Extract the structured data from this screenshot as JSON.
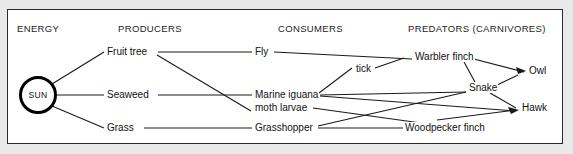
{
  "diagram": {
    "frame_color": "#2b2b2b",
    "background_color": "#e9e9e9",
    "line_color": "#1a1a1a",
    "columns": [
      {
        "label": "ENERGY",
        "x": 17
      },
      {
        "label": "PRODUCERS",
        "x": 118
      },
      {
        "label": "CONSUMERS",
        "x": 278
      },
      {
        "label": "PREDATORS (CARNIVORES)",
        "x": 408
      }
    ],
    "nodes": {
      "sun": {
        "label": "SUN",
        "x": 19,
        "y": 76
      },
      "fruit_tree": {
        "label": "Fruit tree",
        "x": 106,
        "y": 49
      },
      "seaweed": {
        "label": "Seaweed",
        "x": 106,
        "y": 86
      },
      "grass": {
        "label": "Grass",
        "x": 106,
        "y": 122
      },
      "fly": {
        "label": "Fly",
        "x": 254,
        "y": 49
      },
      "marine_iguana": {
        "label": "Marine iguana",
        "x": 254,
        "y": 87
      },
      "moth_larvae": {
        "label": "moth larvae",
        "x": 254,
        "y": 105
      },
      "grasshopper": {
        "label": "Grasshopper",
        "x": 254,
        "y": 124
      },
      "tick": {
        "label": "tick",
        "x": 358,
        "y": 71
      },
      "warbler_finch": {
        "label": "Warbler finch",
        "x": 414,
        "y": 54
      },
      "snake": {
        "label": "Snake",
        "x": 470,
        "y": 88
      },
      "woodpecker_finch": {
        "label": "Woodpecker finch",
        "x": 406,
        "y": 124
      },
      "owl": {
        "label": "Owl",
        "x": 528,
        "y": 70
      },
      "hawk": {
        "label": "Hawk",
        "x": 521,
        "y": 107
      }
    },
    "links": [
      {
        "from": "sun",
        "to": "fruit_tree"
      },
      {
        "from": "sun",
        "to": "seaweed"
      },
      {
        "from": "sun",
        "to": "grass"
      },
      {
        "from": "fruit_tree",
        "to": "fly"
      },
      {
        "from": "fruit_tree",
        "to": "moth_larvae"
      },
      {
        "from": "seaweed",
        "to": "marine_iguana"
      },
      {
        "from": "grass",
        "to": "grasshopper"
      },
      {
        "from": "fly",
        "to": "warbler_finch"
      },
      {
        "from": "marine_iguana",
        "to": "tick"
      },
      {
        "from": "tick",
        "to": "warbler_finch"
      },
      {
        "from": "marine_iguana",
        "to": "snake"
      },
      {
        "from": "marine_iguana",
        "to": "hawk"
      },
      {
        "from": "moth_larvae",
        "to": "woodpecker_finch"
      },
      {
        "from": "grasshopper",
        "to": "woodpecker_finch"
      },
      {
        "from": "grasshopper",
        "to": "snake"
      },
      {
        "from": "woodpecker_finch",
        "to": "hawk"
      },
      {
        "from": "warbler_finch",
        "to": "owl"
      },
      {
        "from": "warbler_finch",
        "to": "snake"
      },
      {
        "from": "snake",
        "to": "owl"
      },
      {
        "from": "snake",
        "to": "hawk"
      }
    ]
  }
}
